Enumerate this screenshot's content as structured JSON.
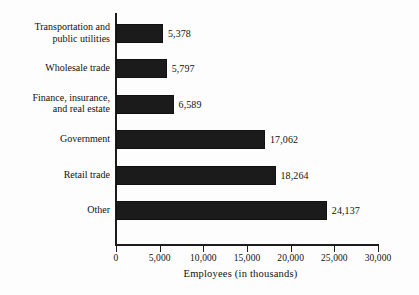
{
  "chart_data": {
    "type": "bar",
    "orientation": "horizontal",
    "title": "",
    "xlabel": "Employees (in thousands)",
    "ylabel": "",
    "xlim": [
      0,
      30000
    ],
    "grid": false,
    "legend": null,
    "xticks": [
      "0",
      "5,000",
      "10,000",
      "15,000",
      "20,000",
      "25,000",
      "30,000"
    ],
    "xtick_values": [
      0,
      5000,
      10000,
      15000,
      20000,
      25000,
      30000
    ],
    "categories": [
      "Transportation and\npublic utilities",
      "Wholesale trade",
      "Finance, insurance,\nand real estate",
      "Government",
      "Retail trade",
      "Other"
    ],
    "values": [
      5378,
      5797,
      6589,
      17062,
      18264,
      24137
    ],
    "value_labels": [
      "5,378",
      "5,797",
      "6,589",
      "17,062",
      "18,264",
      "24,137"
    ],
    "bar_color": "#1b1b1b",
    "axis_color": "#1c1c1c",
    "background_color": "#fdfdfd"
  }
}
